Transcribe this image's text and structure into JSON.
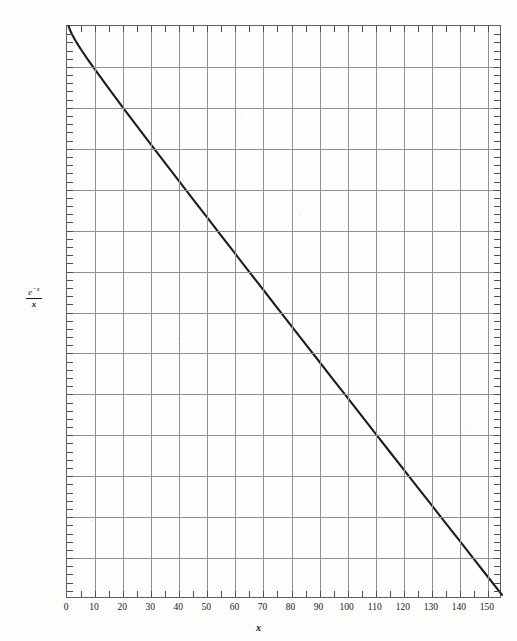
{
  "figure": {
    "background_color": "#fdfdfb",
    "frame_color": "#5a5f68",
    "grid_color": "#8b9099",
    "curve_color": "#1c1c1c"
  },
  "axis_titles": {
    "y_numerator": "e",
    "y_numerator_exponent": "−x",
    "y_denominator": "x",
    "y_full": "e^(-x)/x",
    "x": "x"
  },
  "chart_data": {
    "type": "line",
    "title": "",
    "subtitle": "",
    "xlabel": "x",
    "ylabel": "e^(-x)/x",
    "xscale": "linear",
    "yscale": "log",
    "xlim": [
      0,
      155
    ],
    "ylim": [
      1e-70,
      1
    ],
    "grid": true,
    "legend": "none",
    "x_major_ticks": [
      0,
      10,
      20,
      30,
      40,
      50,
      60,
      70,
      80,
      90,
      100,
      110,
      120,
      130,
      140,
      150
    ],
    "x_minor_tick_step": 5,
    "x_tick_labels": [
      "0",
      "10",
      "20",
      "30",
      "40",
      "50",
      "60",
      "70",
      "80",
      "90",
      "100",
      "110",
      "120",
      "130",
      "140",
      "150"
    ],
    "y_major_exponents": [
      0,
      -5,
      -10,
      -15,
      -20,
      -25,
      -30,
      -35,
      -40,
      -45,
      -50,
      -55,
      -60,
      -65,
      -70
    ],
    "y_tick_labels": [
      "1",
      "10−5",
      "10−10",
      "10−15",
      "10−20",
      "10−25",
      "10−30",
      "10−35",
      "10−40",
      "10−45",
      "10−50",
      "10−55",
      "10−60",
      "10−65",
      "10−70"
    ],
    "y_minor_ticks_per_decade_block": 5,
    "series": [
      {
        "name": "e^(-x)/x",
        "x": [
          0.57,
          1,
          2,
          3,
          4,
          5,
          7.5,
          10,
          15,
          20,
          25,
          30,
          35,
          40,
          45,
          50,
          55,
          60,
          65,
          70,
          75,
          80,
          85,
          90,
          95,
          100,
          105,
          110,
          115,
          120,
          125,
          130,
          135,
          140,
          145,
          150,
          155
        ],
        "y_log10": [
          0.0,
          -0.434,
          -1.17,
          -1.78,
          -2.34,
          -2.87,
          -4.13,
          -5.34,
          -7.69,
          -9.99,
          -12.26,
          -14.51,
          -16.74,
          -18.98,
          -21.2,
          -23.42,
          -25.64,
          -27.85,
          -30.06,
          -32.25,
          -34.47,
          -36.67,
          -38.87,
          -41.05,
          -43.25,
          -45.44,
          -47.64,
          -49.82,
          -52.01,
          -54.2,
          -56.39,
          -58.57,
          -60.76,
          -62.94,
          -65.12,
          -67.31,
          -69.49
        ],
        "endpoint_start": {
          "x": 0.57,
          "y": 1.0
        },
        "endpoint_end": {
          "x": 155,
          "y": 3.2e-70
        }
      }
    ]
  }
}
